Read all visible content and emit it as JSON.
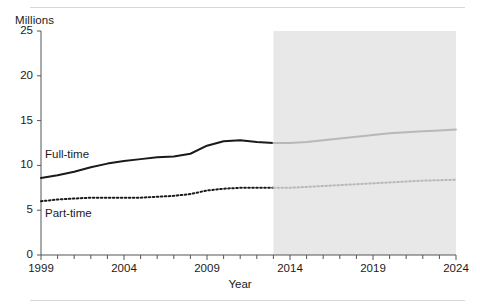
{
  "figure": {
    "unit_label": "Millions",
    "projection_label": "Projected",
    "xaxis_title": "Year"
  },
  "chart_data": {
    "type": "line",
    "title": "",
    "subtitle": "",
    "xlabel": "Year",
    "ylabel": "Millions",
    "xlim": [
      1999,
      2024
    ],
    "ylim": [
      0,
      25
    ],
    "ytick_labels": [
      "0",
      "5",
      "10",
      "15",
      "20",
      "25"
    ],
    "yticks": [
      0,
      5,
      10,
      15,
      20,
      25
    ],
    "xtick_labels": [
      "1999",
      "2004",
      "2009",
      "2014",
      "2019",
      "2024"
    ],
    "xticks": [
      1999,
      2004,
      2009,
      2014,
      2019,
      2024
    ],
    "minor_xticks_every": 1,
    "grid": false,
    "legend": "inline-annotations",
    "annotations": [
      {
        "text": "Projected",
        "x": 2019,
        "y": 23.5
      },
      {
        "text": "Full-time",
        "x": 2000.5,
        "y": 11.2
      },
      {
        "text": "Part-time",
        "x": 2000.5,
        "y": 4.6
      }
    ],
    "projection_start": 2013,
    "projection_end": 2024,
    "projection_shading_color": "#e8e8e8",
    "x": [
      1999,
      2000,
      2001,
      2002,
      2003,
      2004,
      2005,
      2006,
      2007,
      2008,
      2009,
      2010,
      2011,
      2012,
      2013,
      2014,
      2015,
      2016,
      2017,
      2018,
      2019,
      2020,
      2021,
      2022,
      2023,
      2024
    ],
    "series": [
      {
        "name": "Full-time",
        "style": "solid",
        "color": "#1a1a1a",
        "projected_color": "#b8b8b8",
        "values": [
          8.6,
          8.9,
          9.3,
          9.8,
          10.2,
          10.5,
          10.7,
          10.9,
          11.0,
          11.3,
          12.2,
          12.7,
          12.8,
          12.6,
          12.5,
          12.5,
          12.6,
          12.8,
          13.0,
          13.2,
          13.4,
          13.6,
          13.7,
          13.8,
          13.9,
          14.0
        ]
      },
      {
        "name": "Part-time",
        "style": "dotted",
        "color": "#1a1a1a",
        "projected_color": "#b8b8b8",
        "values": [
          6.0,
          6.2,
          6.3,
          6.4,
          6.4,
          6.4,
          6.4,
          6.5,
          6.6,
          6.8,
          7.2,
          7.4,
          7.5,
          7.5,
          7.5,
          7.5,
          7.6,
          7.7,
          7.8,
          7.9,
          8.0,
          8.1,
          8.2,
          8.3,
          8.35,
          8.4
        ]
      }
    ]
  }
}
